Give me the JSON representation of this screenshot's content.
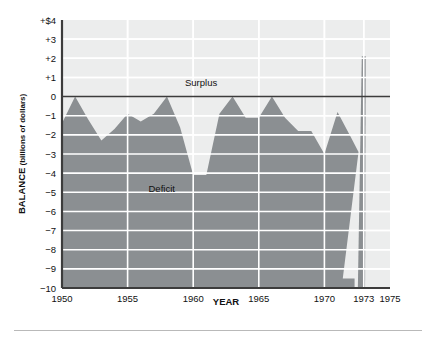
{
  "figure": {
    "background_color": "#ffffff",
    "plot_background_color": "#eceded",
    "area_fill_color": "#8b8f92",
    "gridline_color": "#ffffff",
    "axis_color": "#3c3c3c",
    "zero_line_color": "#3c3c3c",
    "footer_rule_color": "#b9b9b9"
  },
  "chart_data": {
    "type": "area",
    "title": "",
    "subtitle": "",
    "xlabel": "YEAR",
    "ylabel": "BALANCE",
    "ylabel_units": "(billions of dollars)",
    "ylabel_full": "BALANCE (billions of dollars)",
    "xlim": [
      1950,
      1975
    ],
    "ylim": [
      -10,
      4
    ],
    "grid": true,
    "grid_axis": "both",
    "legend_position": "none",
    "y_ticks": [
      4,
      3,
      2,
      1,
      0,
      -1,
      -2,
      -3,
      -4,
      -5,
      -6,
      -7,
      -8,
      -9,
      -10
    ],
    "y_tick_labels": [
      "+$4",
      "+3",
      "+2",
      "+1",
      "0",
      "−1",
      "−2",
      "−3",
      "−4",
      "−5",
      "−6",
      "−7",
      "−8",
      "−9",
      "−10"
    ],
    "x_ticks": [
      1950,
      1955,
      1960,
      1965,
      1970,
      1973,
      1975
    ],
    "x_tick_labels": [
      "1950",
      "1955",
      "1960",
      "1965",
      "1970",
      "1973",
      "1975"
    ],
    "x_gridlines": [
      1950,
      1955,
      1960,
      1965,
      1970,
      1973
    ],
    "annotations": [
      {
        "text": "Surplus",
        "x": 1960.6,
        "y": 0.55,
        "anchor": "middle"
      },
      {
        "text": "Deficit",
        "x": 1957.6,
        "y": -5.0,
        "anchor": "middle"
      }
    ],
    "series": [
      {
        "name": "Federal budget balance",
        "fill_color": "#8b8f92",
        "baseline": -10,
        "x": [
          1950,
          1951,
          1952,
          1953,
          1954,
          1955,
          1956,
          1957,
          1958,
          1959,
          1960,
          1961,
          1962,
          1963,
          1964,
          1965,
          1966,
          1967,
          1968,
          1969,
          1970,
          1971,
          1972,
          1972.6,
          1973
        ],
        "values": [
          -1.4,
          0.0,
          -1.2,
          -2.3,
          -1.7,
          -0.9,
          -1.3,
          -0.9,
          0.0,
          -1.6,
          -4.1,
          -4.1,
          -0.9,
          0.0,
          -1.1,
          -1.1,
          0.0,
          -1.1,
          -1.8,
          -1.8,
          -3.0,
          -0.8,
          -2.1,
          -2.9,
          2.1
        ],
        "notes": "Values read off gridlines; 1970 onward plunges to about -9.5 in 1972 before the 1973 spike to about +2."
      }
    ],
    "data_points_readable": [
      {
        "year": 1950,
        "balance": -1.4
      },
      {
        "year": 1951,
        "balance": 0.0
      },
      {
        "year": 1952,
        "balance": -1.2
      },
      {
        "year": 1953,
        "balance": -2.3
      },
      {
        "year": 1954,
        "balance": -1.7
      },
      {
        "year": 1955,
        "balance": -0.9
      },
      {
        "year": 1956,
        "balance": -1.3
      },
      {
        "year": 1957,
        "balance": -0.9
      },
      {
        "year": 1958,
        "balance": 0.0
      },
      {
        "year": 1959,
        "balance": -1.6
      },
      {
        "year": 1960,
        "balance": -4.1
      },
      {
        "year": 1961,
        "balance": -4.1
      },
      {
        "year": 1962,
        "balance": -0.9
      },
      {
        "year": 1963,
        "balance": 0.0
      },
      {
        "year": 1964,
        "balance": -1.1
      },
      {
        "year": 1965,
        "balance": -1.1
      },
      {
        "year": 1966,
        "balance": 0.0
      },
      {
        "year": 1967,
        "balance": -1.1
      },
      {
        "year": 1968,
        "balance": -1.8
      },
      {
        "year": 1969,
        "balance": -1.8
      },
      {
        "year": 1970,
        "balance": -3.0
      },
      {
        "year": 1971,
        "balance": -0.8
      },
      {
        "year": 1972,
        "balance": -2.1
      },
      {
        "year": 1973,
        "balance": 2.1
      }
    ]
  }
}
